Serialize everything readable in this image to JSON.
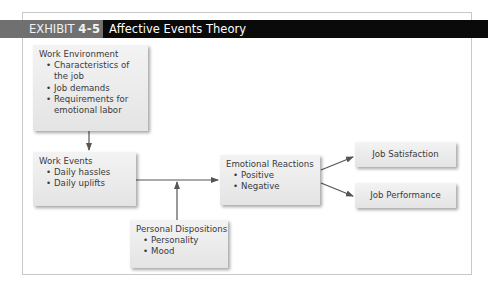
{
  "exhibit": {
    "label_prefix": "EXHIBIT",
    "label_number": "4-5",
    "title": "Affective Events Theory"
  },
  "diagram": {
    "nodes": [
      {
        "id": "work_environment",
        "heading": "Work Environment",
        "items": [
          "Characteristics of the job",
          "Job demands",
          "Requirements for emotional labor"
        ]
      },
      {
        "id": "work_events",
        "heading": "Work Events",
        "items": [
          "Daily hassles",
          "Daily uplifts"
        ]
      },
      {
        "id": "emotional_reactions",
        "heading": "Emotional Reactions",
        "items": [
          "Positive",
          "Negative"
        ]
      },
      {
        "id": "personal_dispositions",
        "heading": "Personal Dispositions",
        "items": [
          "Personality",
          "Mood"
        ]
      },
      {
        "id": "job_satisfaction",
        "heading": "Job Satisfaction"
      },
      {
        "id": "job_performance",
        "heading": "Job Performance"
      }
    ],
    "edges": [
      {
        "from": "work_environment",
        "to": "work_events"
      },
      {
        "from": "work_events",
        "to": "emotional_reactions"
      },
      {
        "from": "personal_dispositions",
        "to": "work_events_to_emotional_reactions_line"
      },
      {
        "from": "emotional_reactions",
        "to": "job_satisfaction"
      },
      {
        "from": "emotional_reactions",
        "to": "job_performance"
      }
    ]
  },
  "colors": {
    "title_bar": "#0a0a0a",
    "label_bg": "#707070",
    "box_fill": "#ececec",
    "arrow": "#555555",
    "frame": "#c8c8c8"
  }
}
